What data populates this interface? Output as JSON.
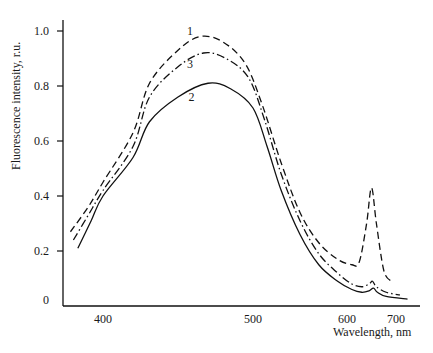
{
  "chart_data": {
    "type": "line",
    "title": "",
    "xlabel": "Wavelength, nm",
    "ylabel": "Fluorescence intensity, r.u.",
    "x_ticks": [
      400,
      500,
      600,
      700
    ],
    "y_ticks": [
      0,
      0.2,
      0.4,
      0.6,
      0.8,
      1.0
    ],
    "y_tick_labels": [
      "0",
      "0.2",
      "0.4",
      "0.6",
      "0.8",
      "1.0"
    ],
    "x_tick_labels": [
      "400",
      "500",
      "600",
      "700"
    ],
    "xlim": [
      375,
      725
    ],
    "ylim": [
      0,
      1.05
    ],
    "x_axis_note": "non-linear wavelength axis (400-500 spaced wider than 500-700)",
    "grid": false,
    "legend": "inline numeric labels 1, 2, 3 near peaks",
    "series": [
      {
        "name": "1",
        "style": "dashed",
        "label_pos": [
          458,
          1.0
        ],
        "points": [
          [
            378,
            0.27
          ],
          [
            390,
            0.36
          ],
          [
            400,
            0.45
          ],
          [
            420,
            0.63
          ],
          [
            431,
            0.81
          ],
          [
            450,
            0.93
          ],
          [
            465,
            0.98
          ],
          [
            480,
            0.96
          ],
          [
            495,
            0.88
          ],
          [
            510,
            0.73
          ],
          [
            530,
            0.52
          ],
          [
            550,
            0.34
          ],
          [
            570,
            0.23
          ],
          [
            590,
            0.17
          ],
          [
            610,
            0.15
          ],
          [
            625,
            0.16
          ],
          [
            640,
            0.3
          ],
          [
            650,
            0.43
          ],
          [
            660,
            0.3
          ],
          [
            675,
            0.13
          ],
          [
            690,
            0.09
          ]
        ]
      },
      {
        "name": "3",
        "style": "dash-dot",
        "label_pos": [
          458,
          0.88
        ],
        "points": [
          [
            380,
            0.24
          ],
          [
            390,
            0.33
          ],
          [
            400,
            0.42
          ],
          [
            420,
            0.58
          ],
          [
            431,
            0.76
          ],
          [
            450,
            0.87
          ],
          [
            467,
            0.92
          ],
          [
            482,
            0.9
          ],
          [
            497,
            0.83
          ],
          [
            512,
            0.68
          ],
          [
            530,
            0.48
          ],
          [
            550,
            0.31
          ],
          [
            570,
            0.19
          ],
          [
            590,
            0.12
          ],
          [
            610,
            0.08
          ],
          [
            630,
            0.07
          ],
          [
            645,
            0.08
          ],
          [
            652,
            0.09
          ],
          [
            660,
            0.07
          ],
          [
            680,
            0.05
          ],
          [
            704,
            0.04
          ]
        ]
      },
      {
        "name": "2",
        "style": "solid",
        "label_pos": [
          459,
          0.76
        ],
        "points": [
          [
            383,
            0.21
          ],
          [
            392,
            0.31
          ],
          [
            400,
            0.4
          ],
          [
            420,
            0.54
          ],
          [
            431,
            0.67
          ],
          [
            450,
            0.76
          ],
          [
            470,
            0.81
          ],
          [
            485,
            0.79
          ],
          [
            500,
            0.72
          ],
          [
            515,
            0.58
          ],
          [
            530,
            0.42
          ],
          [
            550,
            0.26
          ],
          [
            570,
            0.15
          ],
          [
            590,
            0.09
          ],
          [
            610,
            0.06
          ],
          [
            630,
            0.05
          ],
          [
            645,
            0.055
          ],
          [
            654,
            0.065
          ],
          [
            662,
            0.05
          ],
          [
            680,
            0.035
          ],
          [
            712,
            0.025
          ]
        ]
      }
    ]
  }
}
